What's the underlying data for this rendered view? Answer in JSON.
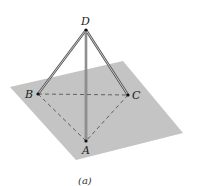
{
  "figure": {
    "caption": "(a)",
    "plane_color": "#c4c4c4",
    "line_color": "#555555",
    "points": {
      "A": {
        "label": "A"
      },
      "B": {
        "label": "B"
      },
      "C": {
        "label": "C"
      },
      "D": {
        "label": "D"
      }
    },
    "edges_solid": [
      "DA",
      "DB",
      "DC"
    ],
    "edges_dashed": [
      "AB",
      "BC",
      "CA"
    ]
  }
}
